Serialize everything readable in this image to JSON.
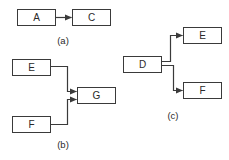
{
  "diagram": {
    "background": "#ffffff",
    "line_color": "#3a3a3a",
    "text_color": "#2a2a2a",
    "panels": [
      {
        "id": "a",
        "caption": "(a)",
        "nodes": [
          {
            "id": "A",
            "label": "A"
          },
          {
            "id": "C",
            "label": "C"
          }
        ],
        "edges": [
          {
            "from": "A",
            "to": "C"
          }
        ]
      },
      {
        "id": "b",
        "caption": "(b)",
        "nodes": [
          {
            "id": "E",
            "label": "E"
          },
          {
            "id": "F",
            "label": "F"
          },
          {
            "id": "G",
            "label": "G"
          }
        ],
        "edges": [
          {
            "from": "E",
            "to": "G"
          },
          {
            "from": "F",
            "to": "G"
          }
        ]
      },
      {
        "id": "c",
        "caption": "(c)",
        "nodes": [
          {
            "id": "D",
            "label": "D"
          },
          {
            "id": "E",
            "label": "E"
          },
          {
            "id": "F",
            "label": "F"
          }
        ],
        "edges": [
          {
            "from": "D",
            "to": "E"
          },
          {
            "from": "D",
            "to": "F"
          }
        ]
      }
    ]
  }
}
